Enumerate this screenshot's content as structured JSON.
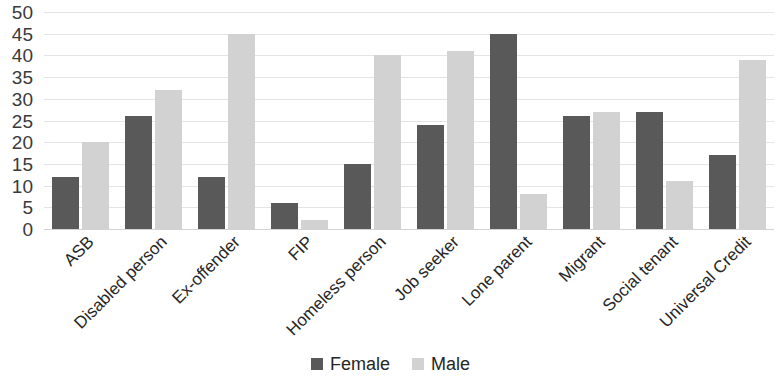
{
  "chart_data": {
    "type": "bar",
    "title": "",
    "subtitle": "",
    "xlabel": "",
    "ylabel": "",
    "ylim": [
      0,
      50
    ],
    "y_ticks": [
      0,
      5,
      10,
      15,
      20,
      25,
      30,
      35,
      40,
      45,
      50
    ],
    "grid": true,
    "legend_position": "bottom",
    "categories": [
      "ASB",
      "Disabled person",
      "Ex-offender",
      "FIP",
      "Homeless person",
      "Job seeker",
      "Lone parent",
      "Migrant",
      "Social tenant",
      "Universal Credit"
    ],
    "series": [
      {
        "name": "Female",
        "color": "#595959",
        "values": [
          12,
          26,
          12,
          6,
          15,
          24,
          45,
          26,
          27,
          17
        ]
      },
      {
        "name": "Male",
        "color": "#d2d2d2",
        "values": [
          20,
          32,
          45,
          2,
          40,
          41,
          8,
          27,
          11,
          39
        ]
      }
    ]
  }
}
